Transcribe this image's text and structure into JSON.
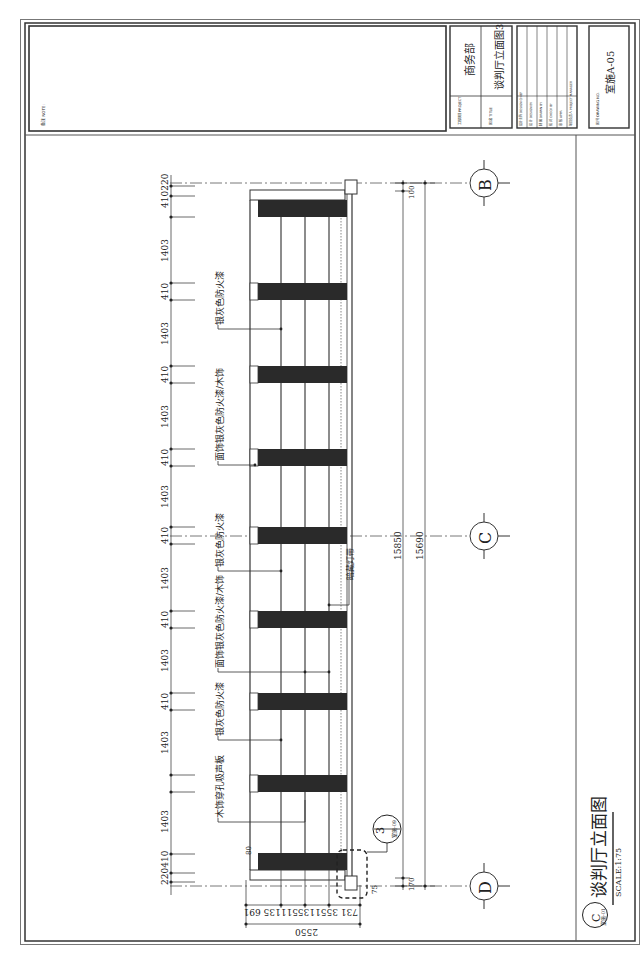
{
  "drawing": {
    "title": "谈判厅立面图",
    "elevation_mark": "C",
    "elevation_ref": "室施-01",
    "scale": "SCALE:1:75",
    "orientation": "rotated 90° clockwise (landscape sheet shown in portrait)"
  },
  "title_block": {
    "remarks_label": "备注 NOTE:",
    "project_label": "工程项目 PROJECT",
    "project_value": "商务部",
    "title_label": "图 名 TITLE",
    "title_value": "谈判厅立面图3",
    "sign_rows": [
      "设计主持 DESIGN CHIEF",
      "设 计 DESIGN BY",
      "制 图 DRAWN BY",
      "校 对 CHECK BY",
      "审 核 APPR.",
      "项目负责人 PROJECT MANAGER"
    ],
    "drawing_no_label": "图 号 DRAWING NO.",
    "drawing_no_value": "室施A-05"
  },
  "axes": [
    {
      "id": "B",
      "label": "B"
    },
    {
      "id": "C",
      "label": "C"
    },
    {
      "id": "D",
      "label": "D"
    }
  ],
  "dimensions": {
    "top_chain": [
      "410",
      "220",
      "1403",
      "410",
      "1403",
      "410",
      "1403",
      "410",
      "1403",
      "410",
      "1403",
      "410",
      "1403",
      "410",
      "1403",
      "220",
      "410"
    ],
    "top_chain_display": [
      "410220",
      "1403",
      "410",
      "1403",
      "410",
      "1403",
      "410",
      "1403",
      "410",
      "1403",
      "410",
      "1403",
      "410",
      "1403",
      "220410"
    ],
    "overall_inner": "15850",
    "overall_outer": "15690",
    "height_chain": [
      "731",
      "355",
      "1135",
      "5",
      "5",
      "1135",
      "691"
    ],
    "height_chain_display": "731  3551135511135  691",
    "overall_height": "2550",
    "small_dims": [
      "80",
      "100",
      "75",
      "170"
    ]
  },
  "annotations": [
    "木饰穿孔吸声板",
    "银灰色防火漆",
    "面饰银灰色防火漆/木饰",
    "银灰色防火漆",
    "暗藏灯带",
    "面饰银灰色防火漆/木饰",
    "银灰色防火漆"
  ],
  "detail_callout": {
    "number": "3",
    "ref": "室施-09"
  },
  "colors": {
    "line": "#333333",
    "frame": "#777777",
    "fill_dark": "#2a2a2a",
    "paper": "#ffffff"
  }
}
